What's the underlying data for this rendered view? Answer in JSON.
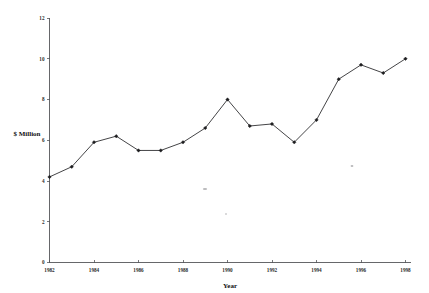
{
  "chart_data": {
    "type": "line",
    "title": "",
    "xlabel": "Year",
    "ylabel": "$ Million",
    "x": [
      1982,
      1983,
      1984,
      1985,
      1986,
      1987,
      1988,
      1989,
      1990,
      1991,
      1992,
      1993,
      1994,
      1995,
      1996,
      1997,
      1998
    ],
    "values": [
      4.2,
      4.7,
      5.9,
      6.2,
      5.5,
      5.5,
      5.9,
      6.6,
      8.0,
      6.7,
      6.8,
      5.9,
      7.0,
      9.0,
      9.7,
      9.3,
      10.0
    ],
    "series": [
      {
        "name": "",
        "values": [
          4.2,
          4.7,
          5.9,
          6.2,
          5.5,
          5.5,
          5.9,
          6.6,
          8.0,
          6.7,
          6.8,
          5.9,
          7.0,
          9.0,
          9.7,
          9.3,
          10.0
        ]
      }
    ],
    "xlim": [
      1982,
      1998
    ],
    "ylim": [
      0,
      12
    ],
    "xticks": [
      1982,
      1984,
      1986,
      1988,
      1990,
      1992,
      1994,
      1996,
      1998
    ],
    "xticklabels": [
      "1982",
      "1984",
      "1986",
      "1988",
      "1990",
      "1992",
      "1994",
      "1996",
      "1998"
    ],
    "yticks": [
      0,
      2,
      4,
      6,
      8,
      10,
      12
    ],
    "yticklabels": [
      "0",
      "2",
      "4",
      "6",
      "8",
      "10",
      "12"
    ],
    "grid": false,
    "legend": false,
    "legend_position": "none",
    "marker": "filled-diamond",
    "line_color": "#3a3a3c",
    "marker_color": "#1d1d1f",
    "axis_color": "#55565a",
    "background_color": "#ffffff"
  }
}
